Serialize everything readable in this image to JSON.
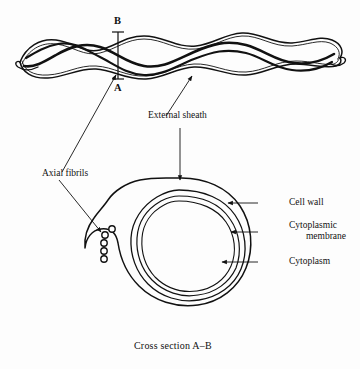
{
  "figure": {
    "caption": "Cross section A–B",
    "background_color": "#fdfdfd",
    "ink_color": "#111111"
  },
  "section_markers": {
    "top": "B",
    "bottom": "A"
  },
  "labels": {
    "axial_fibrils": "Axial fibrils",
    "external_sheath": "External sheath",
    "cell_wall": "Cell wall",
    "cytoplasmic_membrane_line1": "Cytoplasmic",
    "cytoplasmic_membrane_line2": "membrane",
    "cytoplasm": "Cytoplasm"
  },
  "structures": {
    "spirochete_wave_periods": 4,
    "fibril_count": 5,
    "cross_section_rings": [
      "external sheath",
      "cell wall",
      "cytoplasmic membrane",
      "cytoplasm"
    ]
  }
}
